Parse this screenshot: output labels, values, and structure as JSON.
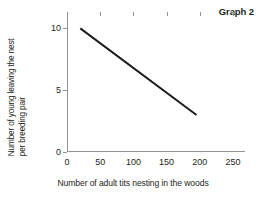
{
  "chart_data": {
    "type": "line",
    "title": "Graph 2",
    "xlabel": "Number of adult tits nesting in the woods",
    "ylabel_lines": [
      "Number of young leaving the nest",
      "per breeding pair"
    ],
    "ylabel": "Number of young leaving the nest per breeding pair",
    "xlim": [
      0,
      268
    ],
    "ylim": [
      0,
      11
    ],
    "xticks": [
      0,
      50,
      100,
      150,
      200,
      250
    ],
    "yticks": [
      0,
      5,
      10
    ],
    "xtick_labels": [
      "0",
      "50",
      "100",
      "150",
      "200",
      "250"
    ],
    "ytick_labels": [
      "0",
      "5",
      "10"
    ],
    "grid": false,
    "legend": false,
    "series": [
      {
        "name": "young per breeding pair",
        "color": "#1a1a1a",
        "points": [
          {
            "x": 20,
            "y": 10
          },
          {
            "x": 195,
            "y": 3
          }
        ]
      }
    ]
  },
  "figure": {
    "graph_label": "Graph 2"
  }
}
